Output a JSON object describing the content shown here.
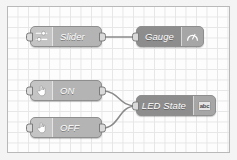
{
  "editor": {
    "name": "node-red-flow-canvas",
    "background_color": "#fdfdfd",
    "grid_color": "#e6e6e6",
    "border_color": "#b9b9b9"
  },
  "nodes": [
    {
      "id": "slider",
      "label": "Slider",
      "icon": "slider-icon",
      "style": "light",
      "label_align": "left",
      "icon_side": "left",
      "has_input": true,
      "has_output": true,
      "x": 22,
      "y": 19,
      "width": 72,
      "height": 21
    },
    {
      "id": "gauge",
      "label": "Gauge",
      "icon": "gauge-icon",
      "style": "dark",
      "label_align": "right",
      "icon_side": "right",
      "has_input": true,
      "has_output": false,
      "x": 128,
      "y": 19,
      "width": 68,
      "height": 21
    },
    {
      "id": "on",
      "label": "ON",
      "icon": "hand-click-icon",
      "style": "light",
      "label_align": "left",
      "icon_side": "left",
      "has_input": true,
      "has_output": true,
      "x": 22,
      "y": 73,
      "width": 72,
      "height": 21
    },
    {
      "id": "off",
      "label": "OFF",
      "icon": "hand-click-icon",
      "style": "light",
      "label_align": "left",
      "icon_side": "left",
      "has_input": true,
      "has_output": true,
      "x": 22,
      "y": 110,
      "width": 72,
      "height": 21
    },
    {
      "id": "led-state",
      "label": "LED State",
      "icon": "abc-text-icon",
      "icon_text": "abc",
      "style": "dark",
      "label_align": "right",
      "icon_side": "right",
      "has_input": true,
      "has_output": false,
      "x": 128,
      "y": 88,
      "width": 80,
      "height": 21
    }
  ],
  "wires": [
    {
      "id": "wire-slider-gauge",
      "from": "slider",
      "to": "gauge",
      "path": "M 94 30 C 107 30, 115 30, 128 30"
    },
    {
      "id": "wire-on-ledstate",
      "from": "on",
      "to": "led-state",
      "path": "M 94 84 C 112 84, 110 99, 128 99"
    },
    {
      "id": "wire-off-ledstate",
      "from": "off",
      "to": "led-state",
      "path": "M 94 121 C 112 121, 110 99, 128 99"
    }
  ],
  "wire_color": "#8a8a8a"
}
